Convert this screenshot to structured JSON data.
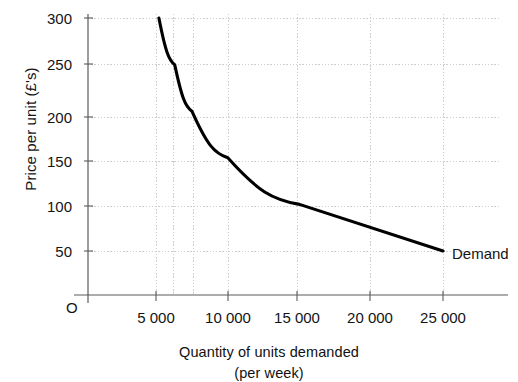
{
  "chart_data": {
    "type": "line",
    "title": "",
    "xlabel": "Quantity of units demanded",
    "xlabel_sub": "(per week)",
    "ylabel": "Price per unit (£'s)",
    "origin_label": "O",
    "grid": true,
    "legend_position": "inline-end-of-line",
    "xlim": [
      0,
      27500
    ],
    "ylim": [
      0,
      300
    ],
    "xticks": [
      5000,
      10000,
      15000,
      20000,
      25000
    ],
    "xtick_labels": [
      "5 000",
      "10 000",
      "15 000",
      "20 000",
      "25 000"
    ],
    "yticks": [
      50,
      100,
      150,
      200,
      250,
      300
    ],
    "ytick_labels": [
      "50",
      "100",
      "150",
      "200",
      "250",
      "300"
    ],
    "series": [
      {
        "name": "Demand",
        "color": "#000000",
        "x": [
          5200,
          6300,
          7500,
          10000,
          15000,
          25000
        ],
        "y": [
          300,
          250,
          200,
          150,
          100,
          50
        ]
      }
    ]
  },
  "annotations": {
    "demand_label": "Demand"
  },
  "colors": {
    "line": "#000000",
    "axis": "#4a4a4a",
    "grid": "#d0d0d0",
    "text": "#141414",
    "background": "#ffffff"
  }
}
